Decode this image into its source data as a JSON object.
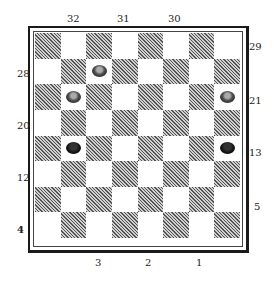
{
  "diagram": {
    "type": "checkerboard",
    "board_size": 8,
    "labels": {
      "top": [
        {
          "text": "32",
          "x": 67,
          "y": 14
        },
        {
          "text": "31",
          "x": 117,
          "y": 14
        },
        {
          "text": "30",
          "x": 168,
          "y": 14
        }
      ],
      "right": [
        {
          "text": "29",
          "x": 249,
          "y": 42
        },
        {
          "text": "21",
          "x": 249,
          "y": 96
        },
        {
          "text": "13",
          "x": 249,
          "y": 148
        },
        {
          "text": "5",
          "x": 254,
          "y": 202
        }
      ],
      "left": [
        {
          "text": "28",
          "x": 17,
          "y": 69
        },
        {
          "text": "20",
          "x": 17,
          "y": 121
        },
        {
          "text": "12",
          "x": 17,
          "y": 173
        },
        {
          "text": "4",
          "x": 17,
          "y": 225,
          "bold": true
        }
      ],
      "bottom": [
        {
          "text": "3",
          "x": 95,
          "y": 258
        },
        {
          "text": "2",
          "x": 145,
          "y": 258
        },
        {
          "text": "1",
          "x": 196,
          "y": 258
        }
      ]
    },
    "pieces": [
      {
        "row": 1,
        "col": 2,
        "color": "white"
      },
      {
        "row": 2,
        "col": 1,
        "color": "white"
      },
      {
        "row": 2,
        "col": 7,
        "color": "white"
      },
      {
        "row": 4,
        "col": 1,
        "color": "black"
      },
      {
        "row": 4,
        "col": 7,
        "color": "black"
      }
    ],
    "colors": {
      "dark_square": "#555555",
      "light_square": "#ffffff",
      "border": "#1a1a1a"
    }
  }
}
